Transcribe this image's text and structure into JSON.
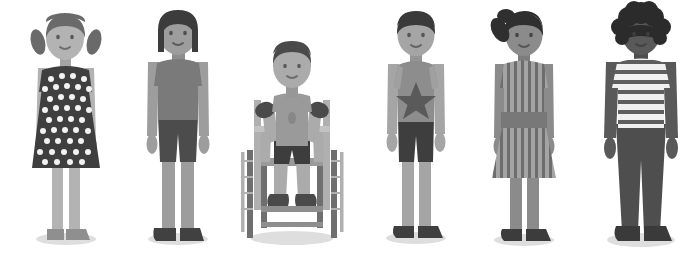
{
  "scene": {
    "title": "Illustration of six diverse children standing in a row",
    "width": 696,
    "height": 265,
    "background_color": "#ffffff",
    "shadow_color": "#d8d8d8",
    "figure_count": 6
  },
  "palette": {
    "white": "#ffffff",
    "skin_light": "#b9b9b9",
    "skin_medium": "#9a9a9a",
    "skin_dark": "#6d6d6d",
    "skin_darkest": "#4e4e4e",
    "hair_dark": "#4a4a4a",
    "hair_black": "#3a3a3a",
    "hair_darkest": "#2e2e2e",
    "garment_dark": "#3f3f3f",
    "garment_mid": "#737373",
    "garment_light": "#a3a3a3",
    "garment_lighter": "#c2c2c2",
    "shoe_dark": "#4c4c4c",
    "metal": "#b0b0b0",
    "metal_dark": "#8c8c8c",
    "shadow": "#dcdcdc"
  },
  "figures": [
    {
      "id": "figure-1",
      "name": "girl-polka-dot-dress",
      "description": "Girl with pigtails wearing a dark polka-dot dress",
      "x": 14,
      "hair_style": "pigtails",
      "skin_tone": "#b3b3b3",
      "hair_color": "#6a6a6a",
      "garment": "polka-dot-dress",
      "garment_color": "#3f3f3f",
      "dot_color": "#f2f2f2",
      "shoe_color": "#8f8f8f",
      "mobility_aid": "none"
    },
    {
      "id": "figure-2",
      "name": "girl-tshirt-shorts",
      "description": "Child with straight shoulder-length hair in a t-shirt and shorts",
      "x": 128,
      "hair_style": "straight-bob",
      "skin_tone": "#9d9d9d",
      "hair_color": "#3c3c3c",
      "garment": "tshirt-and-shorts",
      "garment_color": "#7a7a7a",
      "shorts_color": "#4c4c4c",
      "shoe_color": "#414141",
      "mobility_aid": "none"
    },
    {
      "id": "figure-3",
      "name": "boy-in-wheelchair",
      "description": "Boy seated in a manual wheelchair wearing a t-shirt and shorts",
      "x": 232,
      "hair_style": "short-tousled",
      "skin_tone": "#ababab",
      "hair_color": "#4a4a4a",
      "garment": "tshirt-and-shorts",
      "garment_color": "#9a9a9a",
      "shorts_color": "#3d3d3d",
      "shoe_color": "#4a4a4a",
      "glove_color": "#4a4a4a",
      "mobility_aid": "wheelchair",
      "wheelchair_frame_color": "#b4b4b4",
      "wheelchair_wheel_color": "#6f6f6f"
    },
    {
      "id": "figure-4",
      "name": "boy-star-tshirt",
      "description": "Boy with short dark hair wearing a t-shirt with a star and dark shorts",
      "x": 366,
      "hair_style": "short-bowl",
      "skin_tone": "#a5a5a5",
      "hair_color": "#3a3a3a",
      "garment": "star-tshirt-and-shorts",
      "garment_color": "#8d8d8d",
      "star_color": "#5a5a5a",
      "shorts_color": "#3e3e3e",
      "shoe_color": "#3f3f3f",
      "mobility_aid": "none"
    },
    {
      "id": "figure-5",
      "name": "girl-striped-dress",
      "description": "Girl with a side ponytail wearing a vertically striped dress with a belt",
      "x": 472,
      "hair_style": "side-ponytail",
      "skin_tone": "#8b8b8b",
      "hair_color": "#2f2f2f",
      "garment": "striped-dress",
      "garment_color": "#9f9f9f",
      "stripe_color": "#6d6d6d",
      "belt_color": "#787878",
      "shoe_color": "#3c3c3c",
      "mobility_aid": "none"
    },
    {
      "id": "figure-6",
      "name": "boy-horizontal-stripe-shirt",
      "description": "Boy with curly hair in a horizontally striped shirt and dark trousers",
      "x": 586,
      "hair_style": "curly-afro",
      "skin_tone": "#595959",
      "hair_color": "#2b2b2b",
      "garment": "striped-shirt-and-trousers",
      "garment_color": "#f0f0f0",
      "stripe_color": "#5e5e5e",
      "trousers_color": "#4e4e4e",
      "shoe_color": "#3a3a3a",
      "mobility_aid": "none"
    }
  ]
}
